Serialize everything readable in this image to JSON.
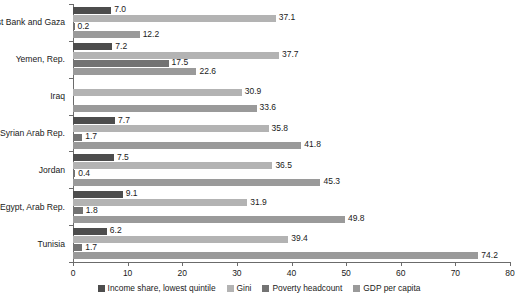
{
  "chart_data": {
    "type": "bar",
    "orientation": "horizontal",
    "title": "",
    "subtitle": "",
    "xlabel": "",
    "ylabel": "",
    "xlim": [
      0,
      80
    ],
    "xticks": [
      0,
      10,
      20,
      30,
      40,
      50,
      60,
      70,
      80
    ],
    "xtick_labels": [
      "0",
      "10",
      "20",
      "30",
      "40",
      "50",
      "60",
      "70",
      "80"
    ],
    "grid": false,
    "legend_position": "bottom",
    "categories": [
      "West Bank and Gaza",
      "Yemen, Rep.",
      "Iraq",
      "Syrian Arab Rep.",
      "Jordan",
      "Egypt,  Arab Rep.",
      "Tunisia"
    ],
    "series": [
      {
        "name": "Income share, lowest quintile",
        "color": "#4d4d4d",
        "values": [
          7.0,
          7.2,
          null,
          7.7,
          7.5,
          9.1,
          6.2
        ],
        "labels": [
          "7.0",
          "7.2",
          "",
          "7.7",
          "7.5",
          "9.1",
          "6.2"
        ]
      },
      {
        "name": "Gini",
        "color": "#b3b3b3",
        "values": [
          37.1,
          37.7,
          30.9,
          35.8,
          36.5,
          31.9,
          39.4
        ],
        "labels": [
          "37.1",
          "37.7",
          "30.9",
          "35.8",
          "36.5",
          "31.9",
          "39.4"
        ]
      },
      {
        "name": "Poverty headcount",
        "color": "#737373",
        "values": [
          0.2,
          17.5,
          null,
          1.7,
          0.4,
          1.8,
          1.7
        ],
        "labels": [
          "0.2",
          "17.5",
          "",
          "1.7",
          "0.4",
          "1.8",
          "1.7"
        ]
      },
      {
        "name": "GDP per capita",
        "color": "#9a9a9a",
        "values": [
          12.2,
          22.6,
          33.6,
          41.8,
          45.3,
          49.8,
          74.2
        ],
        "labels": [
          "12.2",
          "22.6",
          "33.6",
          "41.8",
          "45.3",
          "49.8",
          "74.2"
        ]
      }
    ]
  },
  "legend": {
    "items": [
      {
        "label": "Income share, lowest quintile",
        "color": "#4d4d4d"
      },
      {
        "label": "Gini",
        "color": "#b3b3b3"
      },
      {
        "label": "Poverty headcount",
        "color": "#737373"
      },
      {
        "label": "GDP per capita",
        "color": "#9a9a9a"
      }
    ]
  }
}
